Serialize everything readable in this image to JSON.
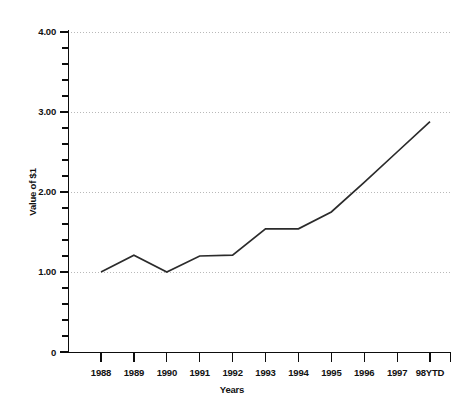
{
  "chart_data": {
    "type": "line",
    "title": "",
    "subtitle": "",
    "xlabel": "Years",
    "ylabel": "Value of $1",
    "categories": [
      "1988",
      "1989",
      "1990",
      "1991",
      "1992",
      "1993",
      "1994",
      "1995",
      "1996",
      "1997",
      "98YTD"
    ],
    "values": [
      1.0,
      1.21,
      1.0,
      1.2,
      1.21,
      1.54,
      1.54,
      1.75,
      2.12,
      2.5,
      2.88
    ],
    "series": [
      {
        "name": "Value of $1",
        "values": [
          1.0,
          1.21,
          1.0,
          1.2,
          1.21,
          1.54,
          1.54,
          1.75,
          2.12,
          2.5,
          2.88
        ]
      }
    ],
    "ylim": [
      0,
      4.0
    ],
    "y_ticks": [
      "0",
      "1.00",
      "2.00",
      "3.00",
      "4.00"
    ],
    "y_tick_values": [
      0,
      1.0,
      2.0,
      3.0,
      4.0
    ],
    "y_minor_tick_count_per_interval": 4,
    "grid": {
      "horizontal": true,
      "vertical": false,
      "style": "dotted",
      "color": "#b9b9b9"
    },
    "legend": {
      "visible": false,
      "position": "none",
      "entries": []
    },
    "line_color": "#2b2b2b",
    "background_color": "#ffffff",
    "axis_color": "#0d0d0d",
    "markers": false,
    "annotations": []
  },
  "axis": {
    "y_label": "Value of $1",
    "x_label": "Years",
    "y_tick_labels": [
      "4.00",
      "3.00",
      "2.00",
      "1.00",
      "0"
    ],
    "x_tick_labels": [
      "1988",
      "1989",
      "1990",
      "1991",
      "1992",
      "1993",
      "1994",
      "1995",
      "1996",
      "1997",
      "98YTD"
    ]
  }
}
